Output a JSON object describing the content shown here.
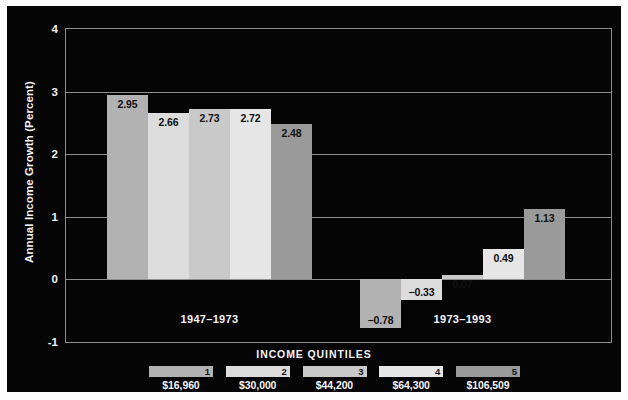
{
  "chart_data": {
    "type": "bar",
    "title": "",
    "xlabel": "INCOME QUINTILES",
    "ylabel": "Annual Income Growth (Percent)",
    "ylim": [
      -1,
      4
    ],
    "yticks": [
      4,
      3,
      2,
      1,
      0,
      -1
    ],
    "grid": true,
    "legend_position": "bottom",
    "categories": [
      "1",
      "2",
      "3",
      "4",
      "5"
    ],
    "group_labels": [
      "1947–1973",
      "1973–1993"
    ],
    "series": [
      {
        "name": "1947–1973",
        "values": [
          2.95,
          2.66,
          2.73,
          2.72,
          2.48
        ]
      },
      {
        "name": "1973–1993",
        "values": [
          -0.78,
          -0.33,
          0.07,
          0.49,
          1.13
        ]
      }
    ],
    "data_labels": {
      "group1": [
        "2.95",
        "2.66",
        "2.73",
        "2.72",
        "2.48"
      ],
      "group2": [
        "−0.78",
        "−0.33",
        "0.07",
        "0.49",
        "1.13"
      ]
    },
    "quintile_incomes": [
      "$16,960",
      "$30,000",
      "$44,200",
      "$64,300",
      "$106,509"
    ],
    "series_colors": [
      "#b2b2b2",
      "#dcdcdc",
      "#c9c9c9",
      "#e6e6e6",
      "#9a9a9a"
    ],
    "background_color": "#050505",
    "axis_color": "#8d8d8d",
    "text_color": "#f4f4f4"
  },
  "axis": {
    "y_title": "Annual Income Growth (Percent)",
    "y_tick_labels": [
      "4",
      "3",
      "2",
      "1",
      "0",
      "-1"
    ],
    "x_title": "INCOME QUINTILES"
  },
  "groups": [
    {
      "label": "1947–1973"
    },
    {
      "label": "1973–1993"
    }
  ],
  "bars": {
    "group1": [
      {
        "quintile": "1",
        "label": "2.95",
        "value": 2.95
      },
      {
        "quintile": "2",
        "label": "2.66",
        "value": 2.66
      },
      {
        "quintile": "3",
        "label": "2.73",
        "value": 2.73
      },
      {
        "quintile": "4",
        "label": "2.72",
        "value": 2.72
      },
      {
        "quintile": "5",
        "label": "2.48",
        "value": 2.48
      }
    ],
    "group2": [
      {
        "quintile": "1",
        "label": "−0.78",
        "value": -0.78
      },
      {
        "quintile": "2",
        "label": "−0.33",
        "value": -0.33
      },
      {
        "quintile": "3",
        "label": "0.07",
        "value": 0.07
      },
      {
        "quintile": "4",
        "label": "0.49",
        "value": 0.49
      },
      {
        "quintile": "5",
        "label": "1.13",
        "value": 1.13
      }
    ]
  },
  "legend": {
    "title": "INCOME QUINTILES",
    "items": [
      {
        "number": "1",
        "amount": "$16,960",
        "color": "#b2b2b2"
      },
      {
        "number": "2",
        "amount": "$30,000",
        "color": "#dcdcdc"
      },
      {
        "number": "3",
        "amount": "$44,200",
        "color": "#c9c9c9"
      },
      {
        "number": "4",
        "amount": "$64,300",
        "color": "#e6e6e6"
      },
      {
        "number": "5",
        "amount": "$106,509",
        "color": "#9a9a9a"
      }
    ]
  }
}
